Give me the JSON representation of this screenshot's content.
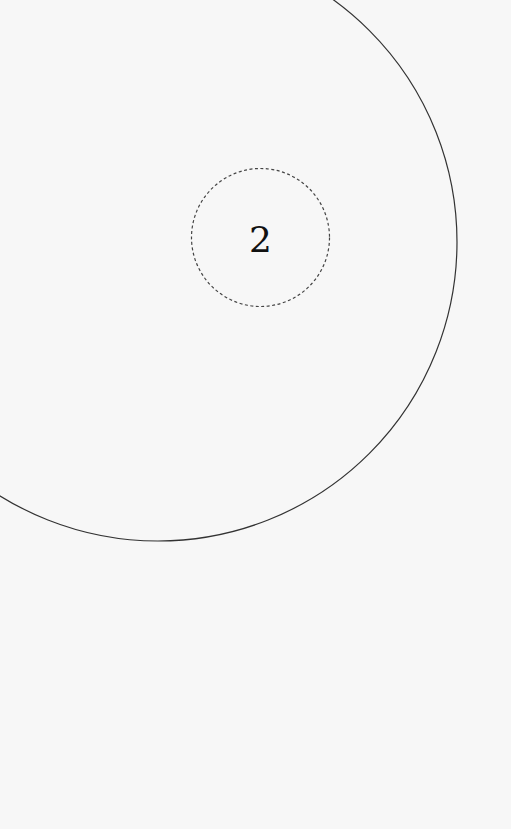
{
  "diagram": {
    "background": "#f7f7f7",
    "outer_circle": {
      "cx": 158,
      "cy": 242,
      "r": 299,
      "stroke": "#333333",
      "style": "solid"
    },
    "inner_circle": {
      "cx": 260.5,
      "cy": 237.5,
      "r": 69,
      "stroke": "#444444",
      "style": "dashed",
      "label": "2"
    }
  }
}
